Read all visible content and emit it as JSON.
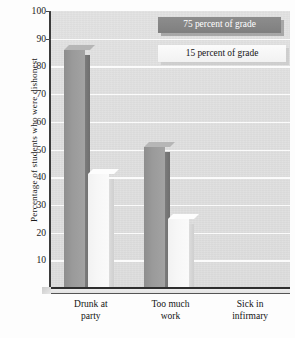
{
  "chart_data": {
    "type": "bar",
    "title": "",
    "xlabel": "",
    "ylabel": "Percentage of students who were dishonest",
    "ylim": [
      0,
      100
    ],
    "yticks": [
      100,
      90,
      80,
      70,
      60,
      50,
      40,
      30,
      20,
      10
    ],
    "grid": true,
    "legend_position": "top-right",
    "categories": [
      "Drunk at party",
      "Too much work",
      "Sick in infirmary"
    ],
    "category_lines": [
      [
        "Drunk at",
        "party"
      ],
      [
        "Too much",
        "work"
      ],
      [
        "Sick in",
        "infirmary"
      ]
    ],
    "series": [
      {
        "name": "75 percent of grade",
        "values": [
          86,
          51,
          0
        ],
        "color": "#9a9a9a"
      },
      {
        "name": "15 percent of grade",
        "values": [
          41,
          25,
          0
        ],
        "color": "#f7f7f7"
      }
    ]
  },
  "legend": {
    "items": [
      {
        "label": "75 percent of grade"
      },
      {
        "label": "15 percent of grade"
      }
    ]
  },
  "colors": {
    "panel_background": "#e0e0e0",
    "gridline": "#fbfbfb",
    "axis": "#3b3b3b",
    "series_dark": "#9a9a9a",
    "series_light": "#f7f7f7",
    "text": "#1a1a1a"
  }
}
